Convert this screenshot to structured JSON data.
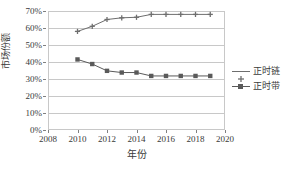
{
  "chart_data": {
    "type": "line",
    "title": "",
    "xlabel": "年份",
    "ylabel": "市场份额",
    "x": [
      2010,
      2011,
      2012,
      2013,
      2014,
      2015,
      2016,
      2017,
      2018,
      2019
    ],
    "xlim": [
      2008,
      2020
    ],
    "ylim": [
      0,
      70
    ],
    "grid": true,
    "legend_position": "right",
    "x_tick_labels": [
      "2008",
      "2010",
      "2012",
      "2014",
      "2016",
      "2018",
      "2020"
    ],
    "x_tick_values": [
      2008,
      2010,
      2012,
      2014,
      2016,
      2018,
      2020
    ],
    "y_tick_labels": [
      "0%",
      "10%",
      "20%",
      "30%",
      "40%",
      "50%",
      "60%",
      "70%"
    ],
    "y_tick_values": [
      0,
      10,
      20,
      30,
      40,
      50,
      60,
      70
    ],
    "series": [
      {
        "name": "正时链",
        "marker": "cross",
        "color": "#6e6e6e",
        "values": [
          58,
          61,
          65,
          66,
          66.3,
          68,
          68,
          68,
          68,
          68
        ]
      },
      {
        "name": "正时带",
        "marker": "square",
        "color": "#5a5a5a",
        "values": [
          41.5,
          38.8,
          34.8,
          33.8,
          33.8,
          31.8,
          31.8,
          31.8,
          31.8,
          31.8
        ]
      }
    ]
  },
  "legend": {
    "items": [
      {
        "label": "正时链"
      },
      {
        "label": "正时带"
      }
    ]
  },
  "axes": {
    "y_title": "市场份额",
    "x_title": "年份"
  },
  "colors": {
    "grid": "#c8c8c8",
    "axis_text": "#3a3a3a",
    "series_1": "#6e6e6e",
    "series_2": "#5a5a5a"
  }
}
